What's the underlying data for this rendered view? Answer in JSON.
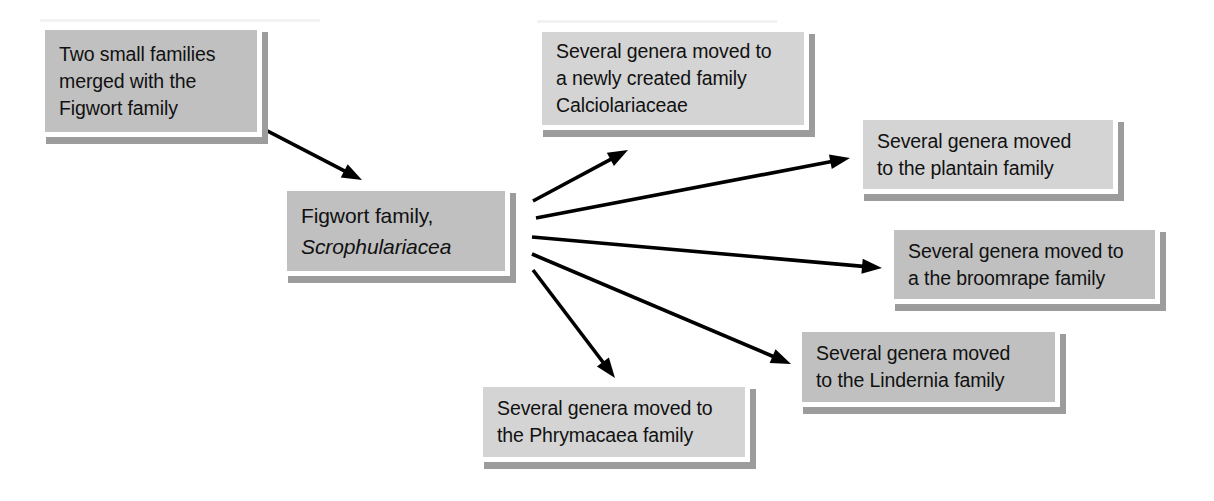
{
  "diagram": {
    "colors": {
      "box_fill_dark": "#c0c0c0",
      "box_fill_light": "#d4d4d4",
      "box_border": "#ffffff",
      "box_shadow": "#9c9c9c",
      "text": "#111111",
      "arrow": "#000000",
      "background": "#ffffff"
    },
    "nodes": [
      {
        "id": "two-small-families",
        "lines": [
          "Two small families",
          "merged with the",
          "Figwort family"
        ],
        "x": 40,
        "y": 25,
        "w": 222,
        "h": 112,
        "fill": "dark",
        "emphasis": false
      },
      {
        "id": "figwort-family",
        "lines": [
          "Figwort family,",
          "Scrophulariacea"
        ],
        "italic_lines": [
          1
        ],
        "x": 282,
        "y": 186,
        "w": 228,
        "h": 90,
        "fill": "dark",
        "emphasis": true
      },
      {
        "id": "calciolariaceae",
        "lines": [
          "Several genera moved to",
          "a newly created family",
          "Calciolariaceae"
        ],
        "x": 537,
        "y": 27,
        "w": 272,
        "h": 103,
        "fill": "light",
        "emphasis": false
      },
      {
        "id": "plantain-family",
        "lines": [
          "Several genera moved",
          "to the plantain family"
        ],
        "x": 858,
        "y": 115,
        "w": 260,
        "h": 79,
        "fill": "light",
        "emphasis": false
      },
      {
        "id": "broomrape-family",
        "lines": [
          "Several genera moved to",
          "a the broomrape family"
        ],
        "x": 889,
        "y": 225,
        "w": 271,
        "h": 79,
        "fill": "dark",
        "emphasis": false
      },
      {
        "id": "lindernia-family",
        "lines": [
          "Several genera moved",
          "to the Lindernia family"
        ],
        "x": 797,
        "y": 327,
        "w": 263,
        "h": 80,
        "fill": "dark",
        "emphasis": false
      },
      {
        "id": "phrymacaea-family",
        "lines": [
          "Several genera moved to",
          "the Phrymacaea family"
        ],
        "x": 478,
        "y": 382,
        "w": 272,
        "h": 80,
        "fill": "light",
        "emphasis": false
      }
    ],
    "arrows": [
      {
        "id": "arrow-merge-into-figwort",
        "from": "two-small-families",
        "to": "figwort-family",
        "x1": 196,
        "y1": 94,
        "x2": 362,
        "y2": 180
      },
      {
        "id": "arrow-figwort-to-calciolariaceae",
        "from": "figwort-family",
        "to": "calciolariaceae",
        "x1": 533,
        "y1": 201,
        "x2": 628,
        "y2": 150
      },
      {
        "id": "arrow-figwort-to-plantain",
        "from": "figwort-family",
        "to": "plantain-family",
        "x1": 536,
        "y1": 218,
        "x2": 850,
        "y2": 158
      },
      {
        "id": "arrow-figwort-to-broomrape",
        "from": "figwort-family",
        "to": "broomrape-family",
        "x1": 532,
        "y1": 237,
        "x2": 882,
        "y2": 268
      },
      {
        "id": "arrow-figwort-to-lindernia",
        "from": "figwort-family",
        "to": "lindernia-family",
        "x1": 532,
        "y1": 254,
        "x2": 791,
        "y2": 364
      },
      {
        "id": "arrow-figwort-to-phrymacaea",
        "from": "figwort-family",
        "to": "phrymacaea-family",
        "x1": 533,
        "y1": 270,
        "x2": 615,
        "y2": 378
      }
    ]
  }
}
